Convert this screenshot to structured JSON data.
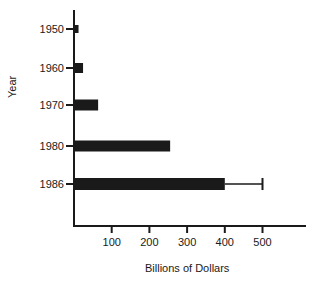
{
  "chart_data": {
    "type": "bar",
    "orientation": "horizontal",
    "title": "",
    "xlabel": "Billions of Dollars",
    "ylabel": "Year",
    "categories": [
      "1950",
      "1960",
      "1970",
      "1980",
      "1986"
    ],
    "values": [
      12,
      24,
      64,
      255,
      400
    ],
    "error_bars": [
      null,
      null,
      null,
      null,
      {
        "upper": 500
      }
    ],
    "xticks": [
      100,
      200,
      300,
      400,
      500
    ],
    "xlim": [
      0,
      610
    ],
    "grid": false,
    "legend": null,
    "bar_color": "#1a1a1a"
  }
}
